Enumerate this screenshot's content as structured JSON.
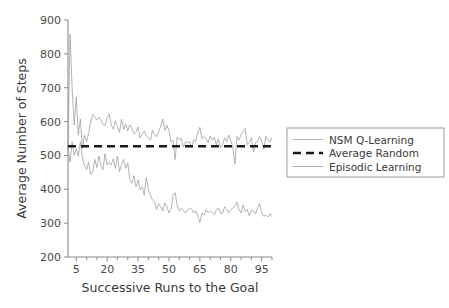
{
  "chart_data": {
    "type": "line",
    "title": "",
    "xlabel": "Successive Runs to the Goal",
    "ylabel": "Average Number of Steps",
    "xlim": [
      1,
      100
    ],
    "ylim": [
      200,
      900
    ],
    "grid": false,
    "legend_position": "right",
    "xticks": [
      5,
      20,
      35,
      50,
      65,
      80,
      95
    ],
    "xtick_labels": [
      "5",
      "20",
      "35",
      "50",
      "65",
      "80",
      "95"
    ],
    "xminor_ticks": [
      10,
      15,
      25,
      30,
      40,
      45,
      55,
      60,
      70,
      75,
      85,
      90,
      100
    ],
    "yticks": [
      200,
      300,
      400,
      500,
      600,
      700,
      800,
      900
    ],
    "ytick_labels": [
      "200",
      "300",
      "400",
      "500",
      "600",
      "700",
      "800",
      "900"
    ],
    "series": [
      {
        "name": "NSM Q-Learning",
        "style": "solid-thin",
        "color": "#9a9a9a",
        "x": [
          1,
          2,
          3,
          4,
          5,
          6,
          7,
          8,
          9,
          10,
          11,
          12,
          13,
          14,
          15,
          16,
          17,
          18,
          19,
          20,
          21,
          22,
          23,
          24,
          25,
          26,
          27,
          28,
          29,
          30,
          31,
          32,
          33,
          34,
          35,
          36,
          37,
          38,
          39,
          40,
          41,
          42,
          43,
          44,
          45,
          46,
          47,
          48,
          49,
          50,
          51,
          52,
          53,
          54,
          55,
          56,
          57,
          58,
          59,
          60,
          61,
          62,
          63,
          64,
          65,
          66,
          67,
          68,
          69,
          70,
          71,
          72,
          73,
          74,
          75,
          76,
          77,
          78,
          79,
          80,
          81,
          82,
          83,
          84,
          85,
          86,
          87,
          88,
          89,
          90,
          91,
          92,
          93,
          94,
          95,
          96,
          97,
          98,
          99,
          100
        ],
        "values": [
          523,
          858,
          700,
          590,
          672,
          560,
          607,
          520,
          560,
          540,
          565,
          600,
          621,
          613,
          605,
          613,
          603,
          592,
          589,
          612,
          622,
          590,
          578,
          602,
          585,
          568,
          607,
          577,
          593,
          572,
          590,
          581,
          563,
          570,
          584,
          552,
          563,
          572,
          558,
          553,
          545,
          574,
          563,
          555,
          570,
          587,
          607,
          574,
          589,
          573,
          540,
          545,
          488,
          555,
          546,
          551,
          525,
          540,
          538,
          540,
          524,
          547,
          541,
          568,
          583,
          549,
          556,
          549,
          537,
          558,
          545,
          553,
          531,
          549,
          522,
          532,
          552,
          541,
          560,
          545,
          524,
          475,
          556,
          545,
          562,
          571,
          580,
          532,
          539,
          552,
          510,
          538,
          540,
          555,
          542,
          518,
          556,
          545,
          540,
          552
        ]
      },
      {
        "name": "Episodic Learning",
        "style": "solid-thin",
        "color": "#9a9a9a",
        "x": [
          1,
          2,
          3,
          4,
          5,
          6,
          7,
          8,
          9,
          10,
          11,
          12,
          13,
          14,
          15,
          16,
          17,
          18,
          19,
          20,
          21,
          22,
          23,
          24,
          25,
          26,
          27,
          28,
          29,
          30,
          31,
          32,
          33,
          34,
          35,
          36,
          37,
          38,
          39,
          40,
          41,
          42,
          43,
          44,
          45,
          46,
          47,
          48,
          49,
          50,
          51,
          52,
          53,
          54,
          55,
          56,
          57,
          58,
          59,
          60,
          61,
          62,
          63,
          64,
          65,
          66,
          67,
          68,
          69,
          70,
          71,
          72,
          73,
          74,
          75,
          76,
          77,
          78,
          79,
          80,
          81,
          82,
          83,
          84,
          85,
          86,
          87,
          88,
          89,
          90,
          91,
          92,
          93,
          94,
          95,
          96,
          97,
          98,
          99,
          100
        ],
        "values": [
          523,
          480,
          540,
          500,
          520,
          498,
          540,
          492,
          470,
          458,
          480,
          444,
          452,
          488,
          464,
          498,
          470,
          458,
          505,
          472,
          480,
          472,
          490,
          462,
          498,
          452,
          474,
          488,
          462,
          478,
          428,
          418,
          440,
          407,
          428,
          398,
          408,
          382,
          435,
          398,
          382,
          368,
          362,
          340,
          357,
          348,
          336,
          360,
          348,
          330,
          342,
          382,
          390,
          350,
          336,
          344,
          338,
          330,
          338,
          345,
          342,
          330,
          337,
          320,
          302,
          330,
          324,
          340,
          330,
          336,
          330,
          325,
          340,
          345,
          330,
          330,
          348,
          342,
          330,
          338,
          345,
          350,
          362,
          340,
          330,
          354,
          334,
          340,
          322,
          338,
          336,
          328,
          345,
          358,
          330,
          320,
          324,
          318,
          328,
          320
        ]
      },
      {
        "name": "Average Random",
        "style": "dashed-thick",
        "color": "#1a1a1a",
        "constant_value": 527
      }
    ]
  },
  "legend": {
    "entries": [
      {
        "label": "NSM Q-Learning",
        "style": "solid-thin"
      },
      {
        "label": "Average Random",
        "style": "dashed-thick"
      },
      {
        "label": "Episodic Learning",
        "style": "solid-thin"
      }
    ]
  }
}
